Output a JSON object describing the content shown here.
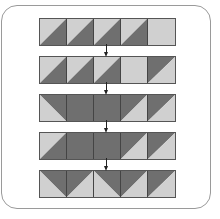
{
  "colors": {
    "light": "#d0d0d0",
    "dark": "#6f6f6f",
    "frame": "#9a9a9a",
    "arrow": "#222222"
  },
  "rows": [
    {
      "cells": [
        "ld-br",
        "ld-br",
        "ld-br",
        "ld-br",
        "light"
      ]
    },
    {
      "cells": [
        "ld-br",
        "ld-br",
        "ld-br",
        "light",
        "dl-br"
      ]
    },
    {
      "cells": [
        "dtr",
        "dark",
        "dark",
        "dl-br",
        "dl-br"
      ]
    },
    {
      "cells": [
        "ld-br",
        "dark",
        "dark",
        "dl-br",
        "dl-br"
      ]
    },
    {
      "cells": [
        "dtr",
        "dl-br",
        "dtr",
        "dl-br",
        "dl-br"
      ]
    }
  ],
  "legend": {
    "ld-br": "light top-left triangle, dark bottom-right triangle",
    "dl-br": "dark top-left triangle, light bottom-right triangle",
    "dtr": "dark top-right triangle, light bottom-left triangle",
    "light": "solid light",
    "dark": "solid dark"
  }
}
